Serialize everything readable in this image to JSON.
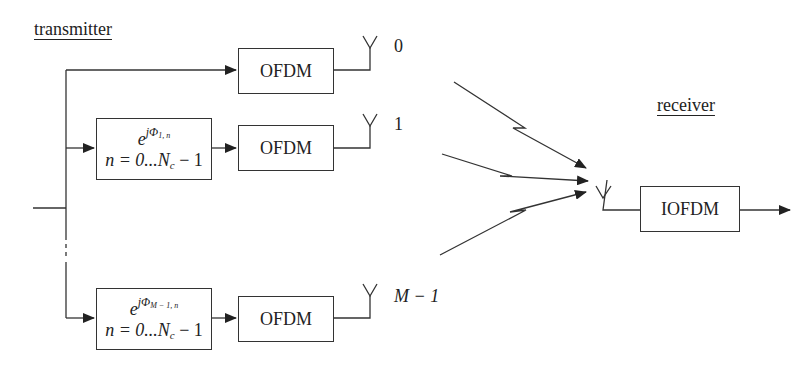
{
  "diagram": {
    "type": "block-diagram",
    "title": "",
    "sections": {
      "transmitter_label": "transmitter",
      "receiver_label": "receiver"
    },
    "branches": [
      {
        "index": 0,
        "phase_block": null,
        "ofdm_label": "OFDM",
        "antenna_label": "0"
      },
      {
        "index": 1,
        "phase_block": {
          "exp_base": "e",
          "exp_sup": "jΦ",
          "exp_sub": "1, n",
          "range": "n = 0...N",
          "range_sub": "c",
          "range_tail": " − 1"
        },
        "ofdm_label": "OFDM",
        "antenna_label": "1"
      },
      {
        "index": "M-1",
        "phase_block": {
          "exp_base": "e",
          "exp_sup": "jΦ",
          "exp_sub": "M − 1, n",
          "range": "n = 0...N",
          "range_sub": "c",
          "range_tail": " − 1"
        },
        "ofdm_label": "OFDM",
        "antenna_label": "M − 1"
      }
    ],
    "receiver_block": "IOFDM",
    "colors": {
      "stroke": "#333333",
      "background": "#ffffff"
    }
  }
}
